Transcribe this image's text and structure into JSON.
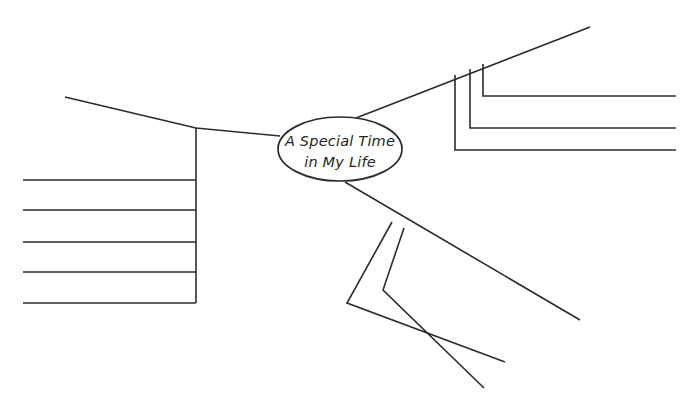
{
  "page": {
    "background_color": "#ffffff",
    "ink_color": "#2b2b2b",
    "width": 694,
    "height": 413
  },
  "center_node": {
    "name": "central-oval",
    "line1": "A Special Time",
    "line2": "in My Life",
    "shape": "ellipse",
    "cx": 340,
    "cy": 149,
    "rx": 62,
    "ry": 32
  },
  "branches": [
    {
      "id": "left-branch",
      "label": "",
      "direction": "left",
      "spine": "M 280 136 L 196 128 L 65 97",
      "writing_lines": [
        {
          "id": "left-line-1",
          "y": 180,
          "x1": 23,
          "x2": 196,
          "text": ""
        },
        {
          "id": "left-line-2",
          "y": 210,
          "x1": 23,
          "x2": 196,
          "text": ""
        },
        {
          "id": "left-line-3",
          "y": 242,
          "x1": 23,
          "x2": 196,
          "text": ""
        },
        {
          "id": "left-line-4",
          "y": 272,
          "x1": 23,
          "x2": 196,
          "text": ""
        },
        {
          "id": "left-line-5",
          "y": 303,
          "x1": 23,
          "x2": 196,
          "text": ""
        }
      ],
      "riser": {
        "x": 196,
        "y1": 128,
        "y2": 303
      }
    },
    {
      "id": "top-right-branch",
      "label": "",
      "direction": "up-right",
      "spine": "M 356 118 L 590 27",
      "brackets": [
        {
          "id": "top-right-bracket-1",
          "path": "M 483 64 L 483 96 L 676 96",
          "text": ""
        },
        {
          "id": "top-right-bracket-2",
          "path": "M 470 69 L 470 128 L 676 128",
          "text": ""
        },
        {
          "id": "top-right-bracket-3",
          "path": "M 455 75 L 455 150 L 676 150",
          "text": ""
        }
      ]
    },
    {
      "id": "bottom-right-branch",
      "label": "",
      "direction": "down-right",
      "spine": "M 345 182 L 580 320",
      "brackets": [
        {
          "id": "bottom-right-bracket-1",
          "path": "M 404 228 L 383 290 L 484 388",
          "text": ""
        },
        {
          "id": "bottom-right-bracket-2",
          "path": "M 392 222 L 347 303 L 505 362",
          "text": ""
        }
      ]
    }
  ]
}
